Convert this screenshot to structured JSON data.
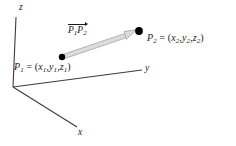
{
  "figure": {
    "background_color": "#ffffff",
    "axis_color": "#3c3c3c",
    "point_color": "#000000",
    "vector_fill_color": "#d8d8d8",
    "vector_stroke_color": "#9a9a9a",
    "text_color": "#1a1a1a",
    "width": 236,
    "height": 146
  },
  "axes": {
    "origin": {
      "x": 13,
      "y": 87
    },
    "z": {
      "name": "z-axis",
      "label": "z",
      "from": {
        "x": 13,
        "y": 87
      },
      "to": {
        "x": 16,
        "y": 17
      }
    },
    "y": {
      "name": "y-axis",
      "label": "y",
      "from": {
        "x": 13,
        "y": 87
      },
      "to": {
        "x": 142,
        "y": 70
      }
    },
    "x": {
      "name": "x-axis",
      "label": "x",
      "from": {
        "x": 13,
        "y": 87
      },
      "to": {
        "x": 77,
        "y": 127
      }
    }
  },
  "points": {
    "p1": {
      "name": "P1",
      "dot": {
        "x": 62,
        "y": 57,
        "r": 3.2
      },
      "label_prefix": "P",
      "label_sub": "1",
      "label_equals": " = (",
      "coords": [
        {
          "var": "x",
          "sub": "1"
        },
        {
          "var": "y",
          "sub": "1"
        },
        {
          "var": "z",
          "sub": "1"
        }
      ],
      "label_close": ")",
      "label_full": "P1 = (x1, y1, z1)"
    },
    "p2": {
      "name": "P2",
      "dot": {
        "x": 139,
        "y": 31,
        "r": 3.8
      },
      "label_prefix": "P",
      "label_sub": "2",
      "label_equals": " = (",
      "coords": [
        {
          "var": "x",
          "sub": "2"
        },
        {
          "var": "y",
          "sub": "2"
        },
        {
          "var": "z",
          "sub": "2"
        }
      ],
      "label_close": ")",
      "label_full": "P2 = (x2, y2, z2)"
    }
  },
  "vector": {
    "name": "vector-p1-p2",
    "label_parts": [
      {
        "var": "P",
        "sub": "1"
      },
      {
        "var": "P",
        "sub": "2"
      }
    ],
    "label_full": "P1P2",
    "overarrow": true,
    "from": {
      "x": 62,
      "y": 57
    },
    "to": {
      "x": 139,
      "y": 31
    },
    "band_half_width": 2.2,
    "arrowhead_length": 11,
    "arrowhead_half_width": 4.2
  },
  "punctuation": {
    "comma": ",",
    "open_paren": "(",
    "close_paren": ")",
    "equals": "="
  }
}
